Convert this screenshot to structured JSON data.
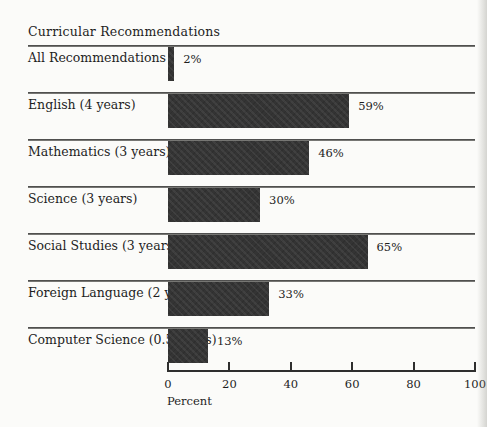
{
  "page": {
    "title": "Curricular Recommendations"
  },
  "chart_data": {
    "type": "bar",
    "orientation": "horizontal",
    "title": "Curricular Recommendations",
    "categories": [
      "All Recommendations",
      "English (4 years)",
      "Mathematics (3 years)",
      "Science (3 years)",
      "Social Studies (3 years)",
      "Foreign Language (2 years)",
      "Computer Science (0.5 years)"
    ],
    "values": [
      2,
      59,
      46,
      30,
      65,
      33,
      13
    ],
    "value_labels": [
      "2%",
      "59%",
      "46%",
      "30%",
      "65%",
      "33%",
      "13%"
    ],
    "xlabel": "Percent",
    "ylabel": "",
    "xlim": [
      0,
      100
    ],
    "x_ticks": [
      0,
      20,
      40,
      60,
      80,
      100
    ],
    "grid": false,
    "legend": false,
    "bar_color": "#343434",
    "separator_color": "#4b4b4b",
    "axis_color": "#2e2e2e"
  }
}
